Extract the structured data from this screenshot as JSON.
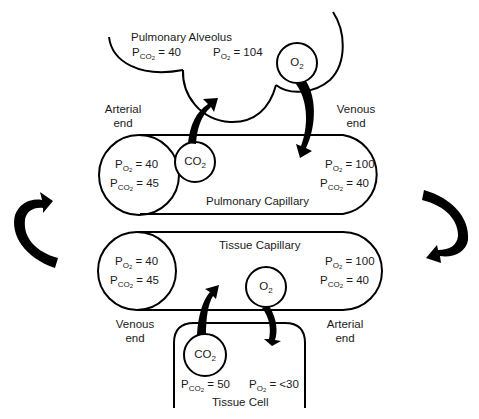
{
  "diagram": {
    "type": "gas-exchange-schematic",
    "alveolus": {
      "title": "Pulmonary Alveolus",
      "pco2": {
        "sym": "P",
        "sub": "CO",
        "sub2": "2",
        "value": "= 40"
      },
      "po2": {
        "sym": "P",
        "sub": "O",
        "sub2": "2",
        "value": "= 104"
      }
    },
    "pulmonary_capillary": {
      "title": "Pulmonary Capillary",
      "left_end_label": [
        "Arterial",
        "end"
      ],
      "right_end_label": [
        "Venous",
        "end"
      ],
      "left": {
        "po2": {
          "sym": "P",
          "sub": "O",
          "sub2": "2",
          "value": "= 40"
        },
        "pco2": {
          "sym": "P",
          "sub": "CO",
          "sub2": "2",
          "value": "= 45"
        }
      },
      "right": {
        "po2": {
          "sym": "P",
          "sub": "O",
          "sub2": "2",
          "value": "= 100"
        },
        "pco2": {
          "sym": "P",
          "sub": "CO",
          "sub2": "2",
          "value": "= 40"
        }
      }
    },
    "tissue_capillary": {
      "title": "Tissue Capillary",
      "left_end_label": [
        "Venous",
        "end"
      ],
      "right_end_label": [
        "Arterial",
        "end"
      ],
      "left": {
        "po2": {
          "sym": "P",
          "sub": "O",
          "sub2": "2",
          "value": "= 40"
        },
        "pco2": {
          "sym": "P",
          "sub": "CO",
          "sub2": "2",
          "value": "= 45"
        }
      },
      "right": {
        "po2": {
          "sym": "P",
          "sub": "O",
          "sub2": "2",
          "value": "= 100"
        },
        "pco2": {
          "sym": "P",
          "sub": "CO",
          "sub2": "2",
          "value": "= 40"
        }
      }
    },
    "tissue_cell": {
      "title": "Tissue Cell",
      "pco2": {
        "sym": "P",
        "sub": "CO",
        "sub2": "2",
        "value": "= 50"
      },
      "po2": {
        "sym": "P",
        "sub": "O",
        "sub2": "2",
        "value": "= <30"
      }
    },
    "gas_bubbles": {
      "alveolus_o2": {
        "base": "O",
        "sub": "2"
      },
      "pulmonary_co2": {
        "base": "CO",
        "sub": "2"
      },
      "tissue_o2": {
        "base": "O",
        "sub": "2"
      },
      "tissue_co2": {
        "base": "CO",
        "sub": "2"
      }
    },
    "colors": {
      "stroke": "#000000",
      "text": "#1a1a1a",
      "background": "#ffffff"
    }
  }
}
